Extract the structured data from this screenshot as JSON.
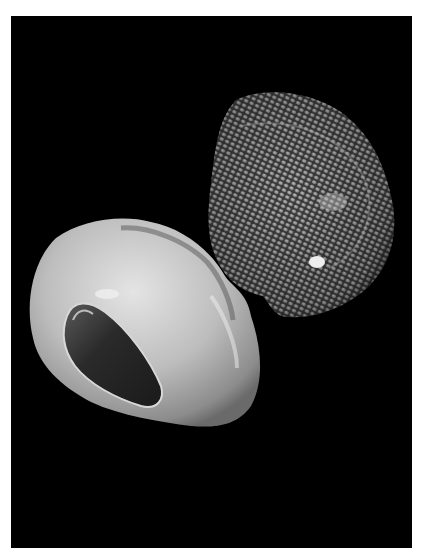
{
  "image": {
    "subject": "Two snail shells photographed on a black background",
    "background_color": "#000000",
    "frame_color": "#ffffff",
    "objects": [
      {
        "name": "textured-shell",
        "description": "Upper-right shell, dorsal view, grey with dense scaly/pebbled surface and a white spot",
        "color": "#8a8a8a"
      },
      {
        "name": "glossy-shell",
        "description": "Lower-left shell, ventral view, smooth glossy pale grey with dark elongated aperture",
        "color": "#c8c8c8"
      }
    ]
  }
}
